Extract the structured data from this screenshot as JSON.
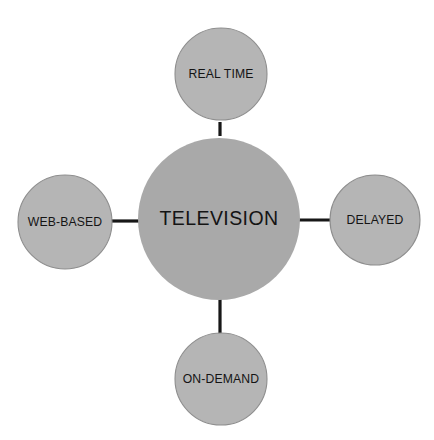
{
  "diagram": {
    "type": "hub-and-spoke",
    "background_color": "#ffffff",
    "connector_color": "#171717",
    "hub_fill_color": "#a9a9a9",
    "leaf_fill_color": "#b5b5b5",
    "leaf_stroke_color": "#8e8e8e",
    "label_color": "#141414",
    "hub": {
      "label": "TELEVISION",
      "cx": 219,
      "cy": 219,
      "r": 81
    },
    "leaves": [
      {
        "id": "real-time",
        "label": "REAL TIME",
        "position": "top",
        "cx": 221,
        "cy": 74,
        "r": 46
      },
      {
        "id": "web-based",
        "label": "WEB-BASED",
        "position": "left",
        "cx": 65,
        "cy": 222,
        "r": 47
      },
      {
        "id": "delayed",
        "label": "DELAYED",
        "position": "right",
        "cx": 375,
        "cy": 220,
        "r": 45
      },
      {
        "id": "on-demand",
        "label": "ON-DEMAND",
        "position": "bottom",
        "cx": 221,
        "cy": 379,
        "r": 46
      }
    ],
    "connectors": [
      {
        "id": "hub-to-real-time",
        "from": "TELEVISION",
        "to": "REAL TIME",
        "x1": 220,
        "y1": 138,
        "x2": 220,
        "y2": 121
      },
      {
        "id": "hub-to-web-based",
        "from": "TELEVISION",
        "to": "WEB-BASED",
        "x1": 112,
        "y1": 221,
        "x2": 139,
        "y2": 221
      },
      {
        "id": "hub-to-delayed",
        "from": "TELEVISION",
        "to": "DELAYED",
        "x1": 300,
        "y1": 220,
        "x2": 330,
        "y2": 220
      },
      {
        "id": "hub-to-on-demand",
        "from": "TELEVISION",
        "to": "ON-DEMAND",
        "x1": 220,
        "y1": 300,
        "x2": 220,
        "y2": 334
      }
    ]
  }
}
